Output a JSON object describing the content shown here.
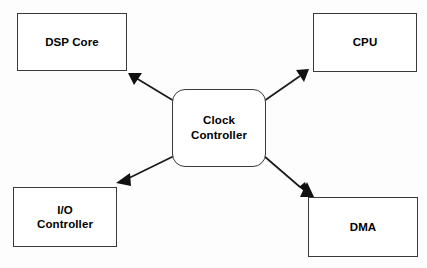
{
  "diagram": {
    "background_color": "#fdfdfd",
    "stroke_color": "#3a3a3a",
    "edge_color": "#1a1a1a",
    "nodes": {
      "clock_controller": {
        "label": "Clock\nController",
        "shape": "rounded-rectangle"
      },
      "dsp_core": {
        "label": "DSP Core",
        "shape": "rectangle"
      },
      "cpu": {
        "label": "CPU",
        "shape": "rectangle"
      },
      "io_controller": {
        "label": "I/O\nController",
        "shape": "rectangle"
      },
      "dma": {
        "label": "DMA",
        "shape": "rectangle"
      }
    },
    "edges": [
      {
        "from": "clock_controller",
        "to": "dsp_core",
        "arrow": "single",
        "direction": "up-left"
      },
      {
        "from": "clock_controller",
        "to": "cpu",
        "arrow": "single",
        "direction": "up-right"
      },
      {
        "from": "clock_controller",
        "to": "io_controller",
        "arrow": "single",
        "direction": "down-left"
      },
      {
        "from": "clock_controller",
        "to": "dma",
        "arrow": "single",
        "direction": "down-right"
      }
    ]
  }
}
